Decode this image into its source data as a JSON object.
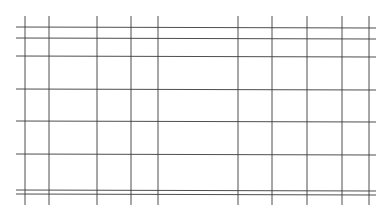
{
  "diagram": {
    "type": "grid",
    "line_color": "#3a3a3a",
    "background": "#ffffff",
    "vertical_lines_x": [
      25,
      49,
      97,
      131,
      158,
      238,
      272,
      307,
      342,
      369
    ],
    "vertical_span": [
      16,
      205
    ],
    "horizontal_lines_y": [
      27,
      38,
      56,
      89,
      121,
      154,
      190,
      194
    ],
    "horizontal_span": [
      16,
      376
    ]
  }
}
